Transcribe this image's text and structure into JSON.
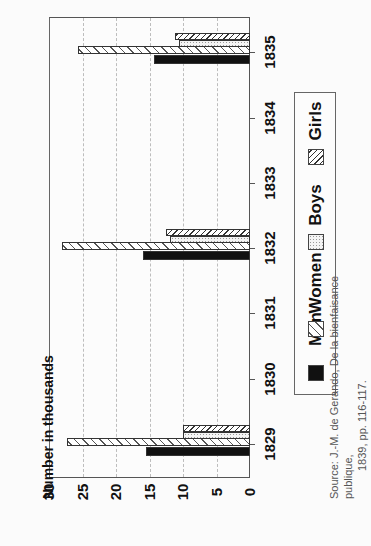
{
  "chart_data": {
    "type": "bar",
    "orientation": "rotated 90° counter-clockwise (horizontal bars on screen)",
    "title": "",
    "ylabel": "Number in thousands",
    "xlabel": "",
    "categories": [
      "1829",
      "1830",
      "1831",
      "1832",
      "1833",
      "1834",
      "1835"
    ],
    "ylim": [
      0,
      30
    ],
    "yticks": [
      "0",
      "5",
      "10",
      "15",
      "20",
      "25",
      "30"
    ],
    "grid": true,
    "legend_position": "right (below plot in rotated frame)",
    "series": [
      {
        "name": "Men",
        "pattern": "solid black",
        "values": [
          15.5,
          null,
          null,
          16.0,
          null,
          null,
          14.3
        ]
      },
      {
        "name": "Women",
        "pattern": "wide diagonal hatch",
        "values": [
          27.3,
          null,
          null,
          28.0,
          null,
          null,
          25.7
        ]
      },
      {
        "name": "Boys",
        "pattern": "fine dots",
        "values": [
          10.0,
          null,
          null,
          12.0,
          null,
          null,
          10.6
        ]
      },
      {
        "name": "Girls",
        "pattern": "dense diagonal hatch",
        "values": [
          10.0,
          null,
          null,
          12.5,
          null,
          null,
          11.2
        ]
      }
    ],
    "source": "Source: J.-M. de Gerando, De la bienfaisance publique, 1839, pp. 116-117."
  },
  "axis": {
    "title": "Number in thousands"
  },
  "legend": {
    "items": [
      {
        "label": "Men"
      },
      {
        "label": "Women"
      },
      {
        "label": "Boys"
      },
      {
        "label": "Girls"
      }
    ]
  },
  "source": {
    "line1": "Source: J.-M. de Gerando, De la bienfaisance publique,",
    "line2": "1839, pp. 116-117."
  }
}
